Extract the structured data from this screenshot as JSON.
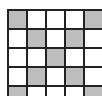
{
  "grid": {
    "rows": 5,
    "cols": 5,
    "fill_color": "#bdbdbd",
    "empty_color": "#ffffff",
    "line_color": "#222222",
    "cells": [
      [
        1,
        0,
        0,
        0,
        1
      ],
      [
        0,
        1,
        0,
        1,
        0
      ],
      [
        0,
        0,
        1,
        0,
        0
      ],
      [
        0,
        1,
        0,
        1,
        0
      ],
      [
        1,
        0,
        0,
        0,
        1
      ]
    ]
  }
}
